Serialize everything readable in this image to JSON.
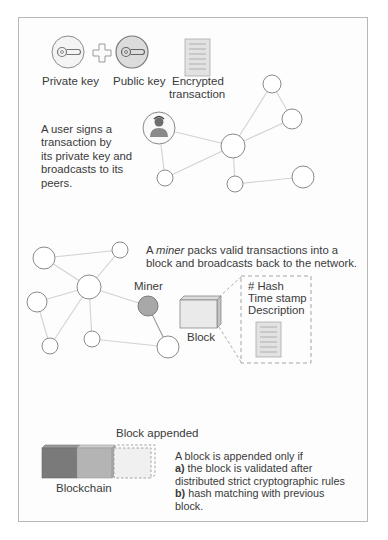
{
  "section1": {
    "private_key_label": "Private key",
    "public_key_label": "Public key",
    "encrypted_label_line1": "Encrypted",
    "encrypted_label_line2": "transaction",
    "description_lines": [
      "A user signs a",
      "transaction by",
      "its private key and",
      "broadcasts to its",
      "peers."
    ],
    "icons": [
      "key-icon",
      "plus-icon",
      "key-icon",
      "document-icon",
      "user-icon"
    ]
  },
  "section2": {
    "description_prefix": "A ",
    "description_italic": "miner",
    "description_line1_rest": " packs valid transactions into a",
    "description_line2": "block and broadcasts back to the network.",
    "miner_label": "Miner",
    "block_label": "Block",
    "block_details": [
      "# Hash",
      "Time stamp",
      "Description"
    ]
  },
  "section3": {
    "block_appended_label": "Block appended",
    "blockchain_label": "Blockchain",
    "rule_intro": "A block is appended only if",
    "rule_a_marker": "a)",
    "rule_a_line1": " the block is validated after",
    "rule_a_line2": "distributed strict cryptographic rules",
    "rule_b_marker": "b)",
    "rule_b_line1": " hash matching with previous",
    "rule_b_line2": "block."
  },
  "colors": {
    "node_stroke": "#8a8a8a",
    "edge": "#d0d0d0",
    "miner_fill": "#a8a8a8",
    "block_dark": "#7a7a7a",
    "block_mid": "#b4b4b4",
    "block_light": "#eeeeee"
  }
}
